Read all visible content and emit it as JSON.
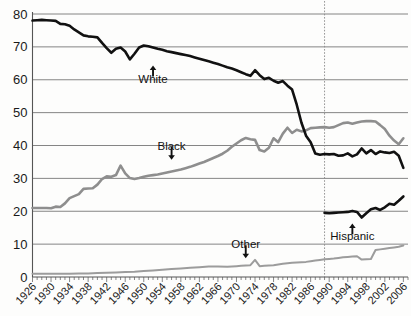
{
  "chart_data": {
    "type": "line",
    "title": "",
    "subtitle": "",
    "xlabel": "",
    "ylabel": "",
    "xlim": [
      1926,
      2007
    ],
    "ylim": [
      0,
      80
    ],
    "grid": true,
    "grid_axis": "y",
    "legend_position": "inline-annotations",
    "y_ticks": [
      "0",
      "10",
      "20",
      "30",
      "40",
      "50",
      "60",
      "70",
      "80"
    ],
    "y_tick_values": [
      0,
      10,
      20,
      30,
      40,
      50,
      60,
      70,
      80
    ],
    "x_ticks": [
      "1926",
      "1930",
      "1934",
      "1938",
      "1942",
      "1946",
      "1950",
      "1954",
      "1958",
      "1962",
      "1966",
      "1970",
      "1974",
      "1978",
      "1982",
      "1986",
      "1990",
      "1994",
      "1998",
      "2002",
      "2006"
    ],
    "x_tick_values": [
      1926,
      1930,
      1934,
      1938,
      1942,
      1946,
      1950,
      1954,
      1958,
      1962,
      1966,
      1970,
      1974,
      1978,
      1982,
      1986,
      1990,
      1994,
      1998,
      2002,
      2006
    ],
    "x_minor_tick_step": 1,
    "annotations": [
      {
        "text": "White",
        "x": 1952,
        "y": 64,
        "arrow": "up",
        "color": "#111111"
      },
      {
        "text": "Black",
        "x": 1956,
        "y": 36,
        "arrow": "down",
        "color": "#111111"
      },
      {
        "text": "Other",
        "x": 1972,
        "y": 6,
        "arrow": "down",
        "color": "#111111"
      },
      {
        "text": "Hispanic",
        "x": 1995,
        "y": 16,
        "arrow": "up",
        "color": "#111111"
      }
    ],
    "vertical_marker": {
      "x": 1989,
      "style": "dashed",
      "color": "#8a8a8a"
    },
    "series": [
      {
        "name": "White",
        "color": "#111111",
        "width": 2.6,
        "x": [
          1926,
          1927,
          1928,
          1929,
          1930,
          1931,
          1932,
          1933,
          1934,
          1935,
          1936,
          1937,
          1938,
          1939,
          1940,
          1941,
          1942,
          1943,
          1944,
          1945,
          1946,
          1947,
          1948,
          1949,
          1950,
          1951,
          1952,
          1953,
          1954,
          1955,
          1956,
          1957,
          1958,
          1959,
          1960,
          1961,
          1962,
          1963,
          1964,
          1965,
          1966,
          1967,
          1968,
          1969,
          1970,
          1971,
          1972,
          1973,
          1974,
          1975,
          1976,
          1977,
          1978,
          1979,
          1980,
          1981,
          1982,
          1983,
          1984,
          1985,
          1986,
          1987,
          1988,
          1989,
          1990,
          1991,
          1992,
          1993,
          1994,
          1995,
          1996,
          1997,
          1998,
          1999,
          2000,
          2001,
          2002,
          2003,
          2004,
          2005,
          2006
        ],
        "values": [
          78.0,
          78.1,
          78.2,
          78.1,
          78.0,
          77.9,
          77.0,
          76.9,
          76.4,
          75.3,
          74.4,
          73.5,
          73.2,
          73.1,
          72.9,
          71.2,
          69.6,
          68.2,
          69.4,
          69.8,
          68.6,
          66.2,
          67.9,
          69.8,
          70.4,
          70.2,
          69.8,
          69.4,
          69.1,
          68.7,
          68.4,
          68.1,
          67.8,
          67.5,
          67.2,
          66.8,
          66.4,
          66.0,
          65.6,
          65.2,
          64.8,
          64.3,
          63.8,
          63.4,
          62.9,
          62.3,
          61.7,
          61.2,
          62.9,
          61.4,
          60.2,
          60.6,
          59.7,
          59.1,
          59.6,
          58.2,
          57.0,
          52.4,
          47.0,
          43.0,
          41.0,
          37.6,
          37.2,
          37.4,
          37.3,
          37.4,
          36.9,
          37.0,
          37.6,
          36.7,
          37.3,
          39.1,
          37.6,
          38.6,
          37.4,
          38.2,
          37.9,
          37.7,
          38.1,
          36.9,
          33.2
        ]
      },
      {
        "name": "Black",
        "color": "#8e8e8e",
        "width": 2.6,
        "x": [
          1926,
          1927,
          1928,
          1929,
          1930,
          1931,
          1932,
          1933,
          1934,
          1935,
          1936,
          1937,
          1938,
          1939,
          1940,
          1941,
          1942,
          1943,
          1944,
          1945,
          1946,
          1947,
          1948,
          1949,
          1950,
          1951,
          1952,
          1953,
          1954,
          1955,
          1956,
          1957,
          1958,
          1959,
          1960,
          1961,
          1962,
          1963,
          1964,
          1965,
          1966,
          1967,
          1968,
          1969,
          1970,
          1971,
          1972,
          1973,
          1974,
          1975,
          1976,
          1977,
          1978,
          1979,
          1980,
          1981,
          1982,
          1983,
          1984,
          1985,
          1986,
          1987,
          1988,
          1989,
          1990,
          1991,
          1992,
          1993,
          1994,
          1995,
          1996,
          1997,
          1998,
          1999,
          2000,
          2001,
          2002,
          2003,
          2004,
          2005,
          2006
        ],
        "values": [
          21.0,
          21.0,
          21.0,
          21.0,
          20.9,
          21.4,
          21.3,
          22.4,
          24.0,
          24.6,
          25.2,
          26.8,
          26.9,
          27.0,
          28.1,
          29.8,
          30.6,
          30.5,
          31.0,
          33.9,
          31.5,
          30.1,
          29.8,
          30.1,
          30.5,
          30.8,
          31.0,
          31.2,
          31.5,
          31.8,
          32.1,
          32.4,
          32.7,
          33.1,
          33.5,
          34.0,
          34.5,
          35.0,
          35.6,
          36.2,
          36.8,
          37.5,
          38.4,
          39.6,
          40.6,
          41.6,
          42.3,
          41.9,
          41.7,
          38.6,
          38.2,
          39.3,
          42.2,
          41.0,
          43.6,
          45.4,
          43.8,
          44.8,
          44.3,
          44.6,
          45.3,
          45.4,
          45.5,
          45.6,
          45.4,
          45.6,
          46.2,
          46.8,
          47.0,
          46.6,
          47.0,
          47.3,
          47.4,
          47.4,
          47.3,
          46.2,
          45.0,
          43.0,
          41.5,
          40.4,
          42.2
        ]
      },
      {
        "name": "Hispanic",
        "color": "#111111",
        "width": 2.6,
        "x": [
          1989,
          1990,
          1991,
          1992,
          1993,
          1994,
          1995,
          1996,
          1997,
          1998,
          1999,
          2000,
          2001,
          2002,
          2003,
          2004,
          2005,
          2006
        ],
        "values": [
          19.5,
          19.4,
          19.5,
          19.6,
          19.7,
          19.8,
          20.1,
          19.8,
          18.1,
          19.4,
          20.6,
          21.0,
          20.4,
          21.2,
          22.3,
          22.0,
          23.2,
          24.5
        ]
      },
      {
        "name": "Other",
        "color": "#9c9c9c",
        "width": 2.0,
        "x": [
          1926,
          1928,
          1930,
          1932,
          1934,
          1936,
          1938,
          1940,
          1942,
          1944,
          1946,
          1948,
          1950,
          1952,
          1954,
          1956,
          1958,
          1960,
          1962,
          1964,
          1966,
          1968,
          1970,
          1971,
          1972,
          1973,
          1974,
          1975,
          1976,
          1977,
          1978,
          1979,
          1980,
          1981,
          1982,
          1983,
          1984,
          1985,
          1986,
          1987,
          1988,
          1989,
          1990,
          1991,
          1992,
          1993,
          1994,
          1995,
          1996,
          1997,
          1998,
          1999,
          2000,
          2001,
          2002,
          2003,
          2004,
          2005,
          2006
        ],
        "values": [
          1.0,
          1.0,
          1.0,
          1.0,
          1.0,
          1.1,
          1.1,
          1.2,
          1.3,
          1.4,
          1.5,
          1.6,
          1.8,
          2.0,
          2.2,
          2.4,
          2.6,
          2.8,
          3.0,
          3.2,
          3.2,
          3.1,
          3.3,
          3.4,
          3.5,
          3.6,
          5.2,
          3.3,
          3.4,
          3.5,
          3.6,
          3.8,
          4.0,
          4.2,
          4.3,
          4.4,
          4.5,
          4.6,
          4.8,
          5.0,
          5.2,
          5.4,
          5.5,
          5.6,
          5.8,
          6.0,
          6.1,
          6.2,
          6.3,
          5.3,
          5.4,
          5.5,
          8.2,
          8.4,
          8.6,
          8.8,
          9.0,
          9.2,
          9.6
        ]
      }
    ]
  },
  "colors": {
    "white_series": "#111111",
    "black_series": "#8e8e8e",
    "hispanic_series": "#111111",
    "other_series": "#9c9c9c",
    "gridline": "#777777",
    "axis": "#555555",
    "divider": "#8a8a8a",
    "background": "#fdfdfc"
  }
}
